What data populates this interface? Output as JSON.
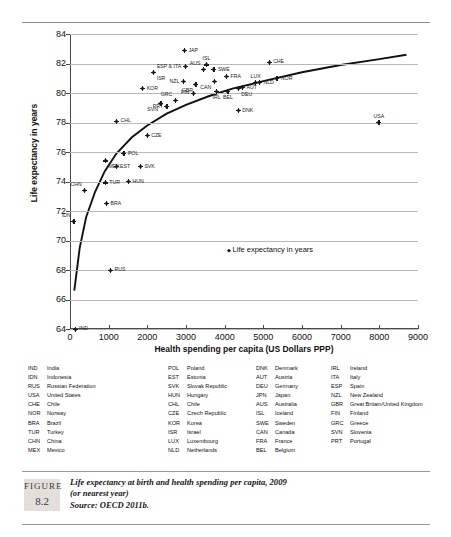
{
  "chart_data": {
    "type": "scatter",
    "title": "",
    "xlabel": "Health spending per capita (US Dollars PPP)",
    "ylabel": "Life expectancy in years",
    "xlim": [
      0,
      9000
    ],
    "ylim": [
      64,
      84
    ],
    "xticks": [
      0,
      1000,
      2000,
      3000,
      4000,
      5000,
      6000,
      7000,
      8000,
      9000
    ],
    "yticks": [
      64,
      66,
      68,
      70,
      72,
      74,
      76,
      78,
      80,
      82,
      84
    ],
    "grid": "horizontal",
    "legend_position": "inside-center-right",
    "legend_entries": [
      "Life expectancy in years"
    ],
    "series_name": "Life expectancy in years",
    "marker": "diamond",
    "trendline": "logarithmic fitted curve",
    "points": [
      {
        "code": "IND",
        "x": 132,
        "y": 64.0,
        "label_pos": "right"
      },
      {
        "code": "IDN",
        "x": 99,
        "y": 71.3,
        "label_pos": "above-left"
      },
      {
        "code": "CHN",
        "x": 379,
        "y": 73.4,
        "label_pos": "above-left"
      },
      {
        "code": "RUS",
        "x": 1050,
        "y": 68.0,
        "label_pos": "right"
      },
      {
        "code": "BRA",
        "x": 943,
        "y": 72.5,
        "label_pos": "right"
      },
      {
        "code": "TUR",
        "x": 913,
        "y": 73.9,
        "label_pos": "right"
      },
      {
        "code": "MEX",
        "x": 916,
        "y": 75.4,
        "label_pos": "below-right"
      },
      {
        "code": "HUN",
        "x": 1511,
        "y": 74.0,
        "label_pos": "right"
      },
      {
        "code": "EST",
        "x": 1192,
        "y": 75.0,
        "label_pos": "right"
      },
      {
        "code": "SVK",
        "x": 1821,
        "y": 75.0,
        "label_pos": "right"
      },
      {
        "code": "POL",
        "x": 1394,
        "y": 75.9,
        "label_pos": "right"
      },
      {
        "code": "CZE",
        "x": 1996,
        "y": 77.1,
        "label_pos": "right"
      },
      {
        "code": "CHL",
        "x": 1200,
        "y": 78.1,
        "label_pos": "right"
      },
      {
        "code": "SVN",
        "x": 2351,
        "y": 79.3,
        "label_pos": "below-left"
      },
      {
        "code": "PRT",
        "x": 2508,
        "y": 79.1,
        "label_pos": "left"
      },
      {
        "code": "GRC",
        "x": 2724,
        "y": 79.5,
        "label_pos": "above-left"
      },
      {
        "code": "KOR",
        "x": 1879,
        "y": 80.3,
        "label_pos": "right"
      },
      {
        "code": "ISR",
        "x": 2165,
        "y": 81.4,
        "label_pos": "below-right"
      },
      {
        "code": "ESP",
        "x": 2980,
        "y": 81.8,
        "label_pos": "left"
      },
      {
        "code": "ITA",
        "x": 2980,
        "y": 81.8,
        "label_pos": "left"
      },
      {
        "code": "JAP",
        "x": 2960,
        "y": 82.9,
        "label_pos": "right"
      },
      {
        "code": "NZL",
        "x": 2930,
        "y": 80.8,
        "label_pos": "left"
      },
      {
        "code": "FIN",
        "x": 3190,
        "y": 80.0,
        "label_pos": "left"
      },
      {
        "code": "GBR",
        "x": 3256,
        "y": 80.6,
        "label_pos": "below-left"
      },
      {
        "code": "AUS",
        "x": 3452,
        "y": 81.6,
        "label_pos": "above-left"
      },
      {
        "code": "ISL",
        "x": 3530,
        "y": 81.9,
        "label_pos": "above"
      },
      {
        "code": "SWE",
        "x": 3722,
        "y": 81.6,
        "label_pos": "right"
      },
      {
        "code": "CAN",
        "x": 3730,
        "y": 80.8,
        "label_pos": "below-left"
      },
      {
        "code": "IRL",
        "x": 3790,
        "y": 80.1,
        "label_pos": "below"
      },
      {
        "code": "FRA",
        "x": 4050,
        "y": 81.1,
        "label_pos": "right"
      },
      {
        "code": "BEL",
        "x": 4085,
        "y": 80.1,
        "label_pos": "below"
      },
      {
        "code": "DEU",
        "x": 4350,
        "y": 80.3,
        "label_pos": "below-right"
      },
      {
        "code": "AUT",
        "x": 4460,
        "y": 80.4,
        "label_pos": "right"
      },
      {
        "code": "DNK",
        "x": 4350,
        "y": 78.8,
        "label_pos": "right"
      },
      {
        "code": "LUX",
        "x": 4800,
        "y": 80.7,
        "label_pos": "above"
      },
      {
        "code": "NLD",
        "x": 4900,
        "y": 80.7,
        "label_pos": "right"
      },
      {
        "code": "CHE",
        "x": 5150,
        "y": 82.1,
        "label_pos": "right"
      },
      {
        "code": "NOR",
        "x": 5350,
        "y": 81.0,
        "label_pos": "right"
      },
      {
        "code": "USA",
        "x": 7990,
        "y": 78.0,
        "label_pos": "above"
      }
    ],
    "curve": [
      {
        "x": 110,
        "y": 66.6
      },
      {
        "x": 250,
        "y": 69.5
      },
      {
        "x": 420,
        "y": 71.6
      },
      {
        "x": 650,
        "y": 73.3
      },
      {
        "x": 900,
        "y": 74.7
      },
      {
        "x": 1200,
        "y": 75.9
      },
      {
        "x": 1600,
        "y": 77.0
      },
      {
        "x": 2000,
        "y": 77.8
      },
      {
        "x": 2500,
        "y": 78.6
      },
      {
        "x": 3000,
        "y": 79.2
      },
      {
        "x": 3600,
        "y": 79.8
      },
      {
        "x": 4200,
        "y": 80.3
      },
      {
        "x": 5000,
        "y": 80.8
      },
      {
        "x": 6000,
        "y": 81.4
      },
      {
        "x": 7000,
        "y": 81.9
      },
      {
        "x": 8000,
        "y": 82.3
      },
      {
        "x": 8700,
        "y": 82.6
      }
    ]
  },
  "axis": {
    "y_title": "Life expectancy in years",
    "x_title": "Health spending per capita (US Dollars PPP)"
  },
  "in_legend": {
    "label": "Life expectancy in years"
  },
  "country_key": {
    "col1": [
      {
        "code": "IND",
        "name": "India"
      },
      {
        "code": "IDN",
        "name": "Indonesia"
      },
      {
        "code": "RUS",
        "name": "Russian Federation"
      },
      {
        "code": "USA",
        "name": "United States"
      },
      {
        "code": "CHE",
        "name": "Chile"
      },
      {
        "code": "NOR",
        "name": "Norway"
      },
      {
        "code": "BRA",
        "name": "Brazil"
      },
      {
        "code": "TUR",
        "name": "Turkey"
      },
      {
        "code": "CHN",
        "name": "China"
      },
      {
        "code": "MEX",
        "name": "Mexico"
      }
    ],
    "col2": [
      {
        "code": "POL",
        "name": "Poland"
      },
      {
        "code": "EST",
        "name": "Estonia"
      },
      {
        "code": "SVK",
        "name": "Slovak Republic"
      },
      {
        "code": "HUN",
        "name": "Hungary"
      },
      {
        "code": "CHL",
        "name": "Chile"
      },
      {
        "code": "CZE",
        "name": "Czech Republic"
      },
      {
        "code": "KOR",
        "name": "Korea"
      },
      {
        "code": "ISR",
        "name": "Israel"
      },
      {
        "code": "LUX",
        "name": "Luxembourg"
      },
      {
        "code": "NLD",
        "name": "Netherlands"
      }
    ],
    "col3": [
      {
        "code": "DNK",
        "name": "Denmark"
      },
      {
        "code": "AUT",
        "name": "Austria"
      },
      {
        "code": "DEU",
        "name": "Germany"
      },
      {
        "code": "JPN",
        "name": "Japan"
      },
      {
        "code": "AUS",
        "name": "Australia"
      },
      {
        "code": "ISL",
        "name": "Iceland"
      },
      {
        "code": "SWE",
        "name": "Sweden"
      },
      {
        "code": "CAN",
        "name": "Canada"
      },
      {
        "code": "FRA",
        "name": "France"
      },
      {
        "code": "BEL",
        "name": "Belgium"
      }
    ],
    "col4": [
      {
        "code": "IRL",
        "name": "Ireland"
      },
      {
        "code": "ITA",
        "name": "Italy"
      },
      {
        "code": "ESP",
        "name": "Spain"
      },
      {
        "code": "NZL",
        "name": "New Zealand"
      },
      {
        "code": "GBR",
        "name": "Great Britain/United Kingdom"
      },
      {
        "code": "FIN",
        "name": "Finland"
      },
      {
        "code": "GRC",
        "name": "Greece"
      },
      {
        "code": "SVN",
        "name": "Slovenia"
      },
      {
        "code": "PRT",
        "name": "Portugal"
      }
    ]
  },
  "figure": {
    "label_word": "FIGURE",
    "number": "8.2",
    "caption_line1": "Life expectancy at birth and health spending per capita, 2009",
    "caption_line2": "(or nearest year)",
    "caption_line3": "Source: OECD 2011b."
  },
  "colors": {
    "marker": "#1a1a1a",
    "gridline": "#b9b9b9",
    "axis": "#4a4a4a",
    "figbox_bg": "#e3e0db",
    "rule": "#9a9a9a"
  }
}
